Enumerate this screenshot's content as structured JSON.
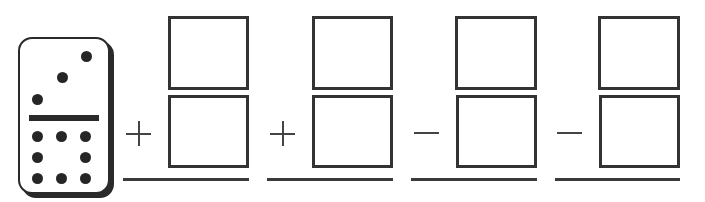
{
  "worksheet": {
    "domino": {
      "top_pips": 3,
      "bottom_pips": 8
    },
    "columns": [
      {
        "operator": "plus",
        "operator_symbol": "+",
        "top_box": "",
        "bottom_box": ""
      },
      {
        "operator": "plus",
        "operator_symbol": "+",
        "top_box": "",
        "bottom_box": ""
      },
      {
        "operator": "minus",
        "operator_symbol": "−",
        "top_box": "",
        "bottom_box": ""
      },
      {
        "operator": "minus",
        "operator_symbol": "−",
        "top_box": "",
        "bottom_box": ""
      }
    ],
    "colors": {
      "ink": "#333333",
      "background": "#ffffff"
    }
  }
}
